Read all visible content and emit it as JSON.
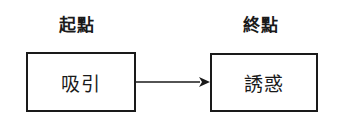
{
  "diagram": {
    "type": "flow",
    "nodes": [
      {
        "id": "start",
        "heading": "起點",
        "text": "吸引"
      },
      {
        "id": "end",
        "heading": "終點",
        "text": "誘惑"
      }
    ],
    "edges": [
      {
        "from": "start",
        "to": "end",
        "style": "arrow"
      }
    ],
    "colors": {
      "stroke": "#1a1a1a",
      "background": "#ffffff"
    }
  }
}
